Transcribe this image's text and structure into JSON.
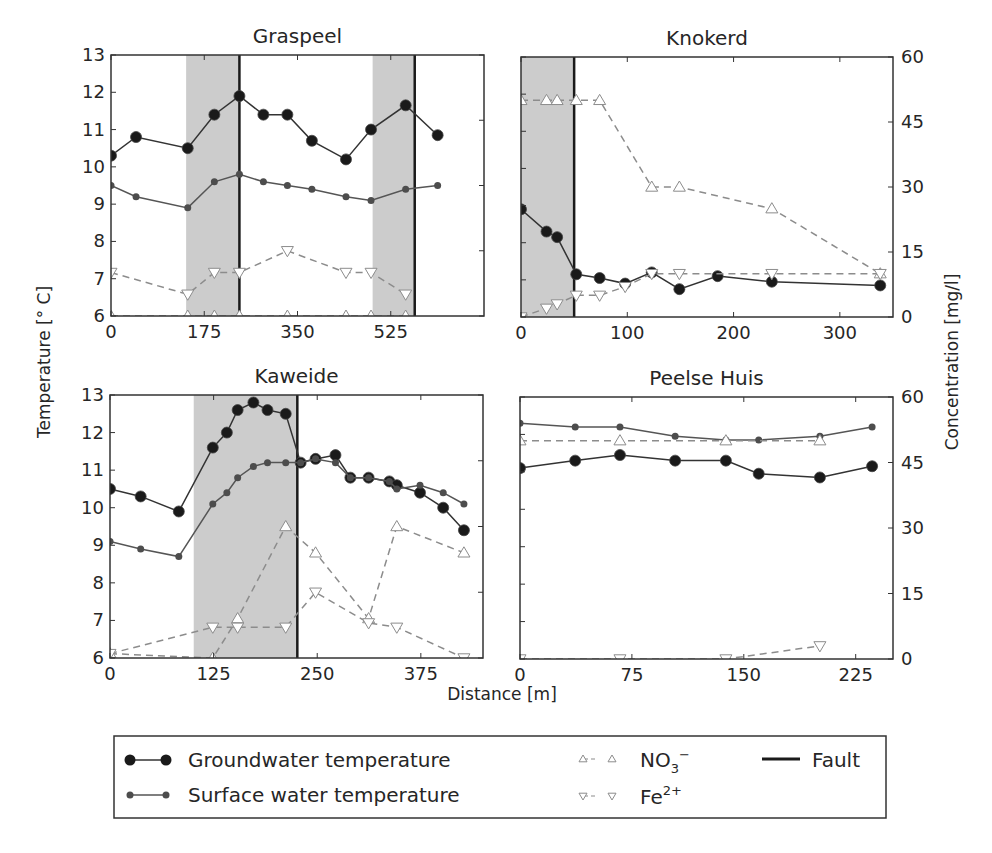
{
  "figure": {
    "xlabel": "Distance [m]",
    "ylabel_left": "Temperature [° C]",
    "ylabel_right": "Concentration [mg/l]",
    "colors": {
      "groundwater": "#1a1a1a",
      "surface": "#4d4d4d",
      "shade": "#cccccc",
      "dashed": "#8c8c8c",
      "fault": "#1a1a1a"
    }
  },
  "legend": {
    "groundwater": "Groundwater temperature",
    "surface": "Surface water temperature",
    "no3": "NO",
    "no3_sub": "3",
    "no3_sup": "−",
    "fe": "Fe",
    "fe_sup": "2+",
    "fault": "Fault"
  },
  "chart_data": [
    {
      "type": "line",
      "title": "Graspeel",
      "xlabel": "Distance [m]",
      "ylabel": "Temperature [° C]",
      "y2label": "Concentration [mg/l]",
      "xlim": [
        0,
        700
      ],
      "ylim": [
        6,
        13
      ],
      "y2lim": [
        0,
        60
      ],
      "xticks": [
        0,
        175,
        350,
        525
      ],
      "yticks": [
        6,
        7,
        8,
        9,
        10,
        11,
        12,
        13
      ],
      "y2ticks": [
        0,
        15,
        30,
        45,
        60
      ],
      "shaded": [
        [
          141,
          241
        ],
        [
          491,
          570
        ]
      ],
      "faults": [
        241,
        570
      ],
      "series": [
        {
          "name": "Groundwater temperature",
          "axis": "left",
          "x": [
            0,
            47,
            144,
            194,
            241,
            286,
            331,
            377,
            441,
            488,
            553,
            613
          ],
          "y": [
            10.3,
            10.8,
            10.5,
            11.4,
            11.9,
            11.4,
            11.4,
            10.7,
            10.2,
            11.0,
            11.65,
            10.85
          ]
        },
        {
          "name": "Surface water temperature",
          "axis": "left",
          "x": [
            0,
            47,
            144,
            194,
            241,
            286,
            331,
            377,
            441,
            488,
            553,
            613
          ],
          "y": [
            9.5,
            9.2,
            8.9,
            9.6,
            9.8,
            9.6,
            9.5,
            9.4,
            9.2,
            9.1,
            9.4,
            9.5
          ]
        },
        {
          "name": "NO3-",
          "axis": "right",
          "x": [
            0,
            144,
            194,
            241,
            331,
            441,
            488,
            553
          ],
          "y": [
            0,
            0,
            0,
            0,
            0,
            0,
            0,
            0
          ]
        },
        {
          "name": "Fe2+",
          "axis": "right",
          "x": [
            0,
            144,
            194,
            241,
            331,
            441,
            488,
            553
          ],
          "y": [
            10,
            5,
            10,
            10,
            15,
            10,
            10,
            5
          ]
        }
      ]
    },
    {
      "type": "line",
      "title": "Knokerd",
      "xlabel": "Distance [m]",
      "ylabel": "Temperature [° C]",
      "y2label": "Concentration [mg/l]",
      "xlim": [
        0,
        350
      ],
      "ylim": [
        6,
        13
      ],
      "y2lim": [
        0,
        60
      ],
      "xticks": [
        0,
        100,
        200,
        300
      ],
      "yticks": [
        6,
        7,
        8,
        9,
        10,
        11,
        12,
        13
      ],
      "y2ticks": [
        0,
        15,
        30,
        45,
        60
      ],
      "shaded": [
        [
          0,
          50
        ]
      ],
      "faults": [
        50
      ],
      "series": [
        {
          "name": "Groundwater temperature",
          "axis": "left",
          "x": [
            0,
            24,
            34,
            52,
            74,
            98,
            123,
            149,
            185,
            236,
            338
          ],
          "y": [
            8.9,
            8.3,
            8.15,
            7.15,
            7.05,
            6.9,
            7.2,
            6.75,
            7.1,
            6.95,
            6.85
          ]
        },
        {
          "name": "NO3-",
          "axis": "right",
          "x": [
            0,
            24,
            34,
            52,
            74,
            123,
            149,
            236,
            338
          ],
          "y": [
            50,
            50,
            50,
            50,
            50,
            30,
            30,
            25,
            10
          ]
        },
        {
          "name": "Fe2+",
          "axis": "right",
          "x": [
            0,
            24,
            34,
            52,
            74,
            98,
            123,
            149,
            236,
            338
          ],
          "y": [
            0,
            2,
            3,
            5,
            5,
            7,
            10,
            10,
            10,
            10
          ]
        }
      ]
    },
    {
      "type": "line",
      "title": "Kaweide",
      "xlabel": "Distance [m]",
      "ylabel": "Temperature [° C]",
      "y2label": "Concentration [mg/l]",
      "xlim": [
        0,
        450
      ],
      "ylim": [
        6,
        13
      ],
      "y2lim": [
        0,
        60
      ],
      "xticks": [
        0,
        125,
        250,
        375
      ],
      "yticks": [
        6,
        7,
        8,
        9,
        10,
        11,
        12,
        13
      ],
      "y2ticks": [
        0,
        15,
        30,
        45,
        60
      ],
      "shaded": [
        [
          101,
          226
        ]
      ],
      "faults": [
        226
      ],
      "series": [
        {
          "name": "Groundwater temperature",
          "axis": "left",
          "x": [
            0,
            37,
            83,
            124,
            141,
            154,
            173,
            190,
            212,
            230,
            248,
            272,
            290,
            312,
            337,
            346,
            374,
            402,
            427
          ],
          "y": [
            10.5,
            10.3,
            9.9,
            11.6,
            12.0,
            12.6,
            12.8,
            12.6,
            12.5,
            11.2,
            11.3,
            11.4,
            10.8,
            10.8,
            10.7,
            10.6,
            10.4,
            10.0,
            9.4
          ]
        },
        {
          "name": "Surface water temperature",
          "axis": "left",
          "x": [
            0,
            37,
            83,
            124,
            141,
            154,
            173,
            190,
            212,
            230,
            248,
            272,
            290,
            312,
            337,
            346,
            374,
            402,
            427
          ],
          "y": [
            9.1,
            8.9,
            8.7,
            10.1,
            10.4,
            10.8,
            11.1,
            11.2,
            11.2,
            11.2,
            11.3,
            11.2,
            10.8,
            10.8,
            10.7,
            10.5,
            10.6,
            10.4,
            10.1
          ]
        },
        {
          "name": "NO3-",
          "axis": "right",
          "x": [
            0,
            124,
            154,
            212,
            248,
            312,
            346,
            427
          ],
          "y": [
            1,
            0,
            9,
            30,
            24,
            9,
            30,
            24
          ]
        },
        {
          "name": "Fe2+",
          "axis": "right",
          "x": [
            0,
            124,
            154,
            212,
            248,
            312,
            346,
            427
          ],
          "y": [
            1,
            7,
            7,
            7,
            15,
            8,
            7,
            0
          ]
        }
      ]
    },
    {
      "type": "line",
      "title": "Peelse Huis",
      "xlabel": "Distance [m]",
      "ylabel": "Temperature [° C]",
      "y2label": "Concentration [mg/l]",
      "xlim": [
        0,
        250
      ],
      "ylim": [
        6,
        13
      ],
      "y2lim": [
        0,
        60
      ],
      "xticks": [
        0,
        75,
        150,
        225
      ],
      "yticks": [
        6,
        7,
        8,
        9,
        10,
        11,
        12,
        13
      ],
      "y2ticks": [
        0,
        15,
        30,
        45,
        60
      ],
      "shaded": [],
      "faults": [],
      "series": [
        {
          "name": "Groundwater temperature",
          "axis": "left",
          "x": [
            0,
            37,
            67,
            104,
            138,
            160,
            201,
            236
          ],
          "y": [
            11.1,
            11.3,
            11.45,
            11.3,
            11.3,
            10.95,
            10.85,
            11.15
          ]
        },
        {
          "name": "Surface water temperature",
          "axis": "left",
          "x": [
            0,
            37,
            67,
            104,
            138,
            160,
            201,
            236
          ],
          "y": [
            12.3,
            12.2,
            12.2,
            11.95,
            11.85,
            11.85,
            11.95,
            12.2
          ]
        },
        {
          "name": "NO3-",
          "axis": "right",
          "x": [
            0,
            67,
            138,
            201
          ],
          "y": [
            50,
            50,
            50,
            50
          ]
        },
        {
          "name": "Fe2+",
          "axis": "right",
          "x": [
            0,
            67,
            138,
            201
          ],
          "y": [
            0,
            0,
            0,
            3
          ]
        }
      ]
    }
  ]
}
